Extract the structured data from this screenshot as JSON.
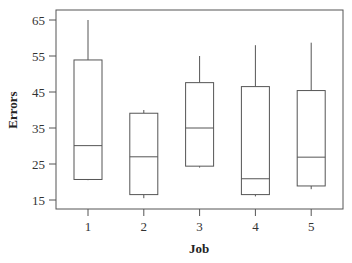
{
  "chart_data": {
    "type": "box",
    "title": "",
    "xlabel": "Job",
    "ylabel": "Errors",
    "categories": [
      "1",
      "2",
      "3",
      "4",
      "5"
    ],
    "yticks": [
      15,
      25,
      35,
      45,
      55,
      65
    ],
    "ylim": [
      13,
      67.5
    ],
    "grid": false,
    "legend": null,
    "series": [
      {
        "name": "Job 1",
        "whisker_low": 20.5,
        "q1": 20.7,
        "median": 30.1,
        "q3": 53.9,
        "whisker_high": 65.0
      },
      {
        "name": "Job 2",
        "whisker_low": 15.5,
        "q1": 16.5,
        "median": 27.0,
        "q3": 39.1,
        "whisker_high": 40.0
      },
      {
        "name": "Job 3",
        "whisker_low": 24.0,
        "q1": 24.4,
        "median": 35.0,
        "q3": 47.6,
        "whisker_high": 55.0
      },
      {
        "name": "Job 4",
        "whisker_low": 16.0,
        "q1": 16.5,
        "median": 20.9,
        "q3": 46.5,
        "whisker_high": 58.0
      },
      {
        "name": "Job 5",
        "whisker_low": 18.0,
        "q1": 18.9,
        "median": 26.9,
        "q3": 45.4,
        "whisker_high": 58.7
      }
    ]
  },
  "colors": {
    "line": "#555555",
    "axis": "#555555",
    "text": "#333333"
  }
}
